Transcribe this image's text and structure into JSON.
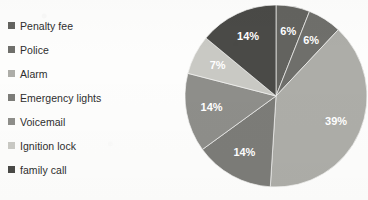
{
  "chart_data": {
    "type": "pie",
    "title": "",
    "subtitle": "",
    "xlabel": "",
    "ylabel": "",
    "legend_position": "left",
    "grid": false,
    "categories": [
      "Penalty fee",
      "Police",
      "Alarm",
      "Emergency lights",
      "Voicemail",
      "Ignition lock",
      "family call"
    ],
    "values": [
      6,
      6,
      39,
      14,
      14,
      7,
      14
    ],
    "value_labels": [
      "6%",
      "6%",
      "39%",
      "14%",
      "14%",
      "7%",
      "14%"
    ],
    "units": "percent",
    "start_angle_deg": 0,
    "direction": "clockwise",
    "colors": [
      "#63635f",
      "#6f6f6b",
      "#adada8",
      "#7c7c78",
      "#8e8e8a",
      "#c9c9c4",
      "#4a4a47"
    ],
    "slices": [
      {
        "label": "Penalty fee",
        "value": 6,
        "display": "6%",
        "color": "#63635f",
        "label_color": "#ffffff"
      },
      {
        "label": "Police",
        "value": 6,
        "display": "6%",
        "color": "#6f6f6b",
        "label_color": "#ffffff"
      },
      {
        "label": "Alarm",
        "value": 39,
        "display": "39%",
        "color": "#adada8",
        "label_color": "#ffffff"
      },
      {
        "label": "Emergency lights",
        "value": 14,
        "display": "14%",
        "color": "#7c7c78",
        "label_color": "#ffffff"
      },
      {
        "label": "Voicemail",
        "value": 14,
        "display": "14%",
        "color": "#8e8e8a",
        "label_color": "#ffffff"
      },
      {
        "label": "Ignition lock",
        "value": 7,
        "display": "7%",
        "color": "#c9c9c4",
        "label_color": "#ffffff"
      },
      {
        "label": "family call",
        "value": 14,
        "display": "14%",
        "color": "#4a4a47",
        "label_color": "#ffffff"
      }
    ]
  },
  "legend": {
    "items": [
      {
        "label": "Penalty fee",
        "color": "#63635f"
      },
      {
        "label": "Police",
        "color": "#6f6f6b"
      },
      {
        "label": "Alarm",
        "color": "#adada8"
      },
      {
        "label": "Emergency lights",
        "color": "#7c7c78"
      },
      {
        "label": "Voicemail",
        "color": "#8e8e8a"
      },
      {
        "label": "Ignition lock",
        "color": "#c9c9c4"
      },
      {
        "label": "family call",
        "color": "#4a4a47"
      }
    ]
  },
  "canvas": {
    "background": "#fdfdfc",
    "pie_center_x": 91,
    "pie_center_y": 91,
    "pie_radius": 91,
    "label_radius_ratio": 0.72
  }
}
